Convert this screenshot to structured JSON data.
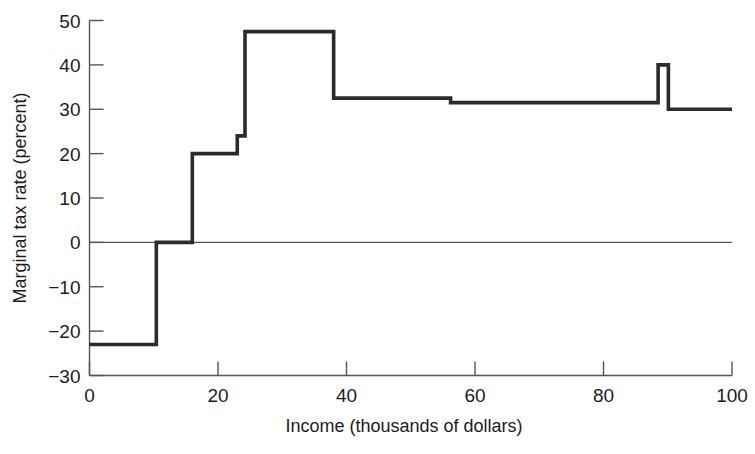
{
  "figure": {
    "background_color": "#ffffff",
    "line_color": "#2b2b2b",
    "axis_color": "#555555"
  },
  "chart_data": {
    "type": "line",
    "subtype": "step",
    "title": "",
    "xlabel": "Income (thousands of dollars)",
    "ylabel": "Marginal tax rate (percent)",
    "xlim": [
      0,
      100
    ],
    "ylim": [
      -30,
      50
    ],
    "grid": false,
    "legend": null,
    "xticks": [
      0,
      20,
      40,
      60,
      80,
      100
    ],
    "xtick_labels": [
      "0",
      "20",
      "40",
      "60",
      "80",
      "100"
    ],
    "yticks": [
      -30,
      -20,
      -10,
      0,
      10,
      20,
      30,
      40,
      50
    ],
    "ytick_labels": [
      "-30",
      "-20",
      "-10",
      "0",
      "10",
      "20",
      "30",
      "40",
      "50"
    ],
    "zero_reference_line": 0,
    "steps": [
      {
        "x_start": 0,
        "x_end": 10.4,
        "value": -23.0
      },
      {
        "x_start": 10.4,
        "x_end": 16.0,
        "value": 0.0
      },
      {
        "x_start": 16.0,
        "x_end": 23.0,
        "value": 20.0
      },
      {
        "x_start": 23.0,
        "x_end": 24.2,
        "value": 24.0
      },
      {
        "x_start": 24.2,
        "x_end": 38.0,
        "value": 47.5
      },
      {
        "x_start": 38.0,
        "x_end": 56.2,
        "value": 32.5
      },
      {
        "x_start": 56.2,
        "x_end": 88.5,
        "value": 31.5
      },
      {
        "x_start": 88.5,
        "x_end": 90.1,
        "value": 40.0
      },
      {
        "x_start": 90.1,
        "x_end": 100,
        "value": 30.0
      }
    ],
    "x": [
      0,
      10.4,
      10.4,
      16,
      16,
      23,
      23,
      24.2,
      24.2,
      38,
      38,
      56.2,
      56.2,
      88.5,
      88.5,
      90.1,
      90.1,
      100
    ],
    "y": [
      -23,
      -23,
      0,
      0,
      20,
      20,
      24,
      24,
      47.5,
      47.5,
      32.5,
      32.5,
      31.5,
      31.5,
      40,
      40,
      30,
      30
    ]
  },
  "caption": {
    "text": ""
  }
}
